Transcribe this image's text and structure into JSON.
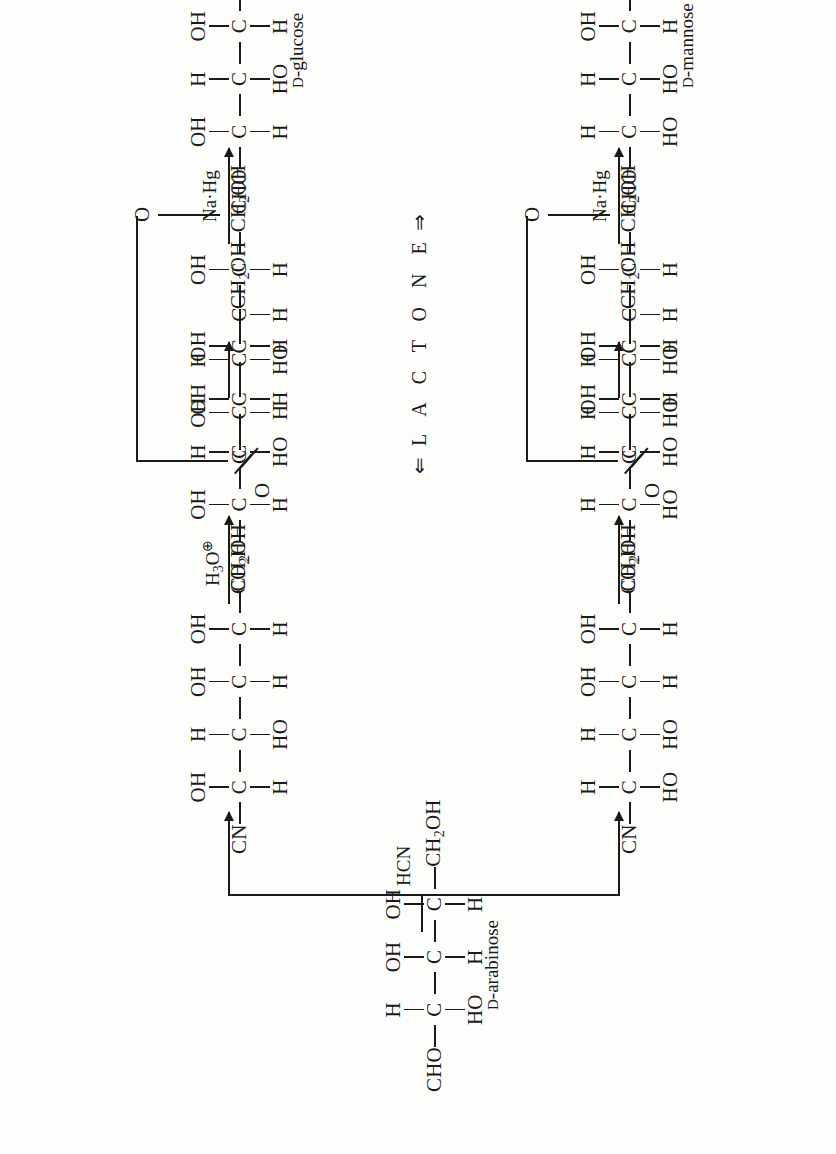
{
  "diagram": {
    "type": "reaction-scheme",
    "orientation": "rotated-90-ccw"
  },
  "labels": {
    "hcn": "HCN",
    "hydronium": "H",
    "hydronium_sub": "3",
    "hydronium_o": "O",
    "hydronium_charge": "⊕",
    "na_hg": "Na·Hg",
    "lactone": "L A C T O N E",
    "lactone_left_arrow": "⇐",
    "lactone_right_arrow": "⇒"
  },
  "names": {
    "arabinose_prefix": "D",
    "arabinose": "-arabinose",
    "glucose_prefix": "D",
    "glucose": "-glucose",
    "mannose_prefix": "D",
    "mannose": "-mannose"
  },
  "molecules": {
    "arabinose": {
      "id": "d-arabinose",
      "top_label": "CHO",
      "bottom_label": "CH",
      "bottom_label_sub": "2",
      "bottom_label_tail": "OH",
      "centers": [
        {
          "right": "H",
          "left": "HO"
        },
        {
          "right": "OH",
          "left": "H"
        },
        {
          "right": "OH",
          "left": "H"
        }
      ],
      "caption": "d-arabinose"
    },
    "glucononitrile": {
      "id": "glucononitrile",
      "top_label": "CN",
      "bottom_label": "CH",
      "bottom_label_sub": "2",
      "bottom_label_tail": "OH",
      "centers": [
        {
          "right": "OH",
          "left": "H"
        },
        {
          "right": "H",
          "left": "HO"
        },
        {
          "right": "OH",
          "left": "H"
        },
        {
          "right": "OH",
          "left": "H"
        }
      ],
      "caption": ""
    },
    "gluconic_acid": {
      "id": "gluconic-acid",
      "top_label": "CO",
      "top_label_sub": "2",
      "top_label_tail": "H",
      "bottom_label": "CH",
      "bottom_label_sub": "2",
      "bottom_label_tail": "OH",
      "centers": [
        {
          "right": "OH",
          "left": "H"
        },
        {
          "right": "H",
          "left": "HO"
        },
        {
          "right": "OH",
          "left": "H"
        },
        {
          "right": "OH",
          "left": "H"
        }
      ],
      "caption": ""
    },
    "glucono_lactone": {
      "id": "glucono-lactone",
      "top_label": "C",
      "carbonyl_o": "O",
      "ring_o": "O",
      "bottom_label": "CH",
      "bottom_label_sub": "2",
      "bottom_label_tail": "OH",
      "centers": [
        {
          "right": "OH",
          "left": "H"
        },
        {
          "right": "H",
          "left": "HO"
        },
        {
          "right": "",
          "left": "H"
        },
        {
          "right": "OH",
          "left": "H"
        }
      ],
      "caption": ""
    },
    "glucose": {
      "id": "d-glucose",
      "top_label": "CHO",
      "bottom_label": "CH",
      "bottom_label_sub": "2",
      "bottom_label_tail": "OH",
      "centers": [
        {
          "right": "OH",
          "left": "H"
        },
        {
          "right": "H",
          "left": "HO"
        },
        {
          "right": "OH",
          "left": "H"
        },
        {
          "right": "OH",
          "left": "H"
        }
      ],
      "caption": "d-glucose"
    },
    "mannononitrile": {
      "id": "mannononitrile",
      "top_label": "CN",
      "bottom_label": "CH",
      "bottom_label_sub": "2",
      "bottom_label_tail": "OH",
      "centers": [
        {
          "right": "H",
          "left": "HO"
        },
        {
          "right": "H",
          "left": "HO"
        },
        {
          "right": "OH",
          "left": "H"
        },
        {
          "right": "OH",
          "left": "H"
        }
      ],
      "caption": ""
    },
    "mannonic_acid": {
      "id": "mannonic-acid",
      "top_label": "CO",
      "top_label_sub": "2",
      "top_label_tail": "H",
      "bottom_label": "CH",
      "bottom_label_sub": "2",
      "bottom_label_tail": "OH",
      "centers": [
        {
          "right": "H",
          "left": "HO"
        },
        {
          "right": "H",
          "left": "HO"
        },
        {
          "right": "OH",
          "left": "H"
        },
        {
          "right": "OH",
          "left": "H"
        }
      ],
      "caption": ""
    },
    "mannono_lactone": {
      "id": "mannono-lactone",
      "top_label": "C",
      "carbonyl_o": "O",
      "ring_o": "O",
      "bottom_label": "CH",
      "bottom_label_sub": "2",
      "bottom_label_tail": "OH",
      "centers": [
        {
          "right": "H",
          "left": "HO"
        },
        {
          "right": "H",
          "left": "HO"
        },
        {
          "right": "",
          "left": "H"
        },
        {
          "right": "OH",
          "left": "H"
        }
      ],
      "caption": ""
    },
    "mannose": {
      "id": "d-mannose",
      "top_label": "CHO",
      "bottom_label": "CH",
      "bottom_label_sub": "2",
      "bottom_label_tail": "OH",
      "centers": [
        {
          "right": "H",
          "left": "HO"
        },
        {
          "right": "H",
          "left": "HO"
        },
        {
          "right": "OH",
          "left": "H"
        },
        {
          "right": "OH",
          "left": "H"
        }
      ],
      "caption": "d-mannose"
    }
  },
  "atoms": {
    "carbon": "C"
  },
  "colors": {
    "ink": "#1a1a1a",
    "paper": "#fdfdfb"
  }
}
